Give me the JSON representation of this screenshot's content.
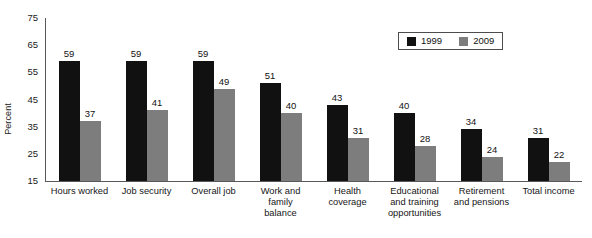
{
  "chart_data": {
    "type": "bar",
    "title": "",
    "xlabel": "",
    "ylabel": "Percent",
    "ylim": [
      15,
      75
    ],
    "yticks": [
      75,
      65,
      55,
      45,
      35,
      25,
      15
    ],
    "grid": false,
    "legend_position": "top-right",
    "categories": [
      "Hours worked",
      "Job security",
      "Overall job",
      "Work and family balance",
      "Health coverage",
      "Educational and training opportunities",
      "Retirement and pensions",
      "Total income"
    ],
    "category_lines": [
      [
        "Hours worked"
      ],
      [
        "Job security"
      ],
      [
        "Overall job"
      ],
      [
        "Work and",
        "family",
        "balance"
      ],
      [
        "Health",
        "coverage"
      ],
      [
        "Educational",
        "and training",
        "opportunities"
      ],
      [
        "Retirement",
        "and pensions"
      ],
      [
        "Total income"
      ]
    ],
    "series": [
      {
        "name": "1999",
        "color": "#111111",
        "values": [
          59,
          59,
          59,
          51,
          43,
          40,
          34,
          31
        ]
      },
      {
        "name": "2009",
        "color": "#7d7d7d",
        "values": [
          37,
          41,
          49,
          40,
          31,
          28,
          24,
          22
        ]
      }
    ]
  },
  "legend": {
    "items": [
      {
        "label": "1999",
        "color": "#111111"
      },
      {
        "label": "2009",
        "color": "#7d7d7d"
      }
    ]
  },
  "axis": {
    "y_title": "Percent",
    "y_ticks": [
      "75",
      "65",
      "55",
      "45",
      "35",
      "25",
      "15"
    ]
  }
}
